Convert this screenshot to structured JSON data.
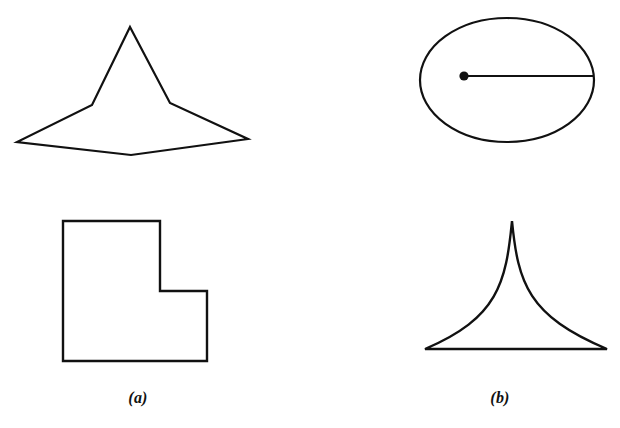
{
  "figure": {
    "width": 620,
    "height": 428,
    "background_color": "#ffffff",
    "stroke_color": "#111111",
    "panels": [
      {
        "id": "panel-a",
        "caption": "(a)",
        "caption_position": {
          "x": 138,
          "y": 400
        },
        "shapes": [
          {
            "name": "concave-star-polygon",
            "type": "polygon",
            "description": "Seven-sided concave star-like polygon with tall central peak, two shoulder notches, two lateral tips and a bottom notch",
            "closed": true,
            "fill": "none",
            "stroke_width": 2.2,
            "points": [
              [
                130,
                27
              ],
              [
                170,
                103
              ],
              [
                248,
                139
              ],
              [
                131,
                155
              ],
              [
                17,
                142
              ],
              [
                92,
                105
              ]
            ]
          },
          {
            "name": "l-shaped-polygon",
            "type": "polygon",
            "description": "Orthogonal L-shaped hexagon (rectilinear polygon with one reflex corner)",
            "closed": true,
            "fill": "none",
            "stroke_width": 2.4,
            "points": [
              [
                63,
                221
              ],
              [
                160,
                221
              ],
              [
                160,
                291
              ],
              [
                207,
                291
              ],
              [
                207,
                361
              ],
              [
                63,
                361
              ]
            ]
          }
        ]
      },
      {
        "id": "panel-b",
        "caption": "(b)",
        "caption_position": {
          "x": 500,
          "y": 400
        },
        "shapes": [
          {
            "name": "ellipse-with-radius",
            "type": "ellipse",
            "description": "Ellipse with a marked interior point and a straight segment from that point to the ellipse boundary",
            "fill": "none",
            "stroke_width": 2.2,
            "center": [
              507,
              80
            ],
            "rx": 87,
            "ry": 62
          },
          {
            "name": "center-dot",
            "type": "dot",
            "description": "Filled circular marker at the left end of the radius segment",
            "fill": "#111111",
            "center": [
              464,
              76
            ],
            "r": 4.6
          },
          {
            "name": "radius-line",
            "type": "line",
            "description": "Horizontal segment from the marked point to the right side of the ellipse",
            "stroke_width": 2.2,
            "from": [
              464,
              76
            ],
            "to": [
              594,
              76
            ]
          },
          {
            "name": "cusp-spike-shape",
            "type": "path",
            "description": "Cusped spike with two concave curved sides meeting at a sharp apex above a flat base",
            "fill": "none",
            "stroke_width": 2.4,
            "apex": [
              512,
              221
            ],
            "base_left": [
              425,
              349
            ],
            "base_right": [
              607,
              349
            ],
            "left_control": [
              498,
              318
            ],
            "right_control": [
              528,
              316
            ]
          }
        ]
      }
    ]
  }
}
